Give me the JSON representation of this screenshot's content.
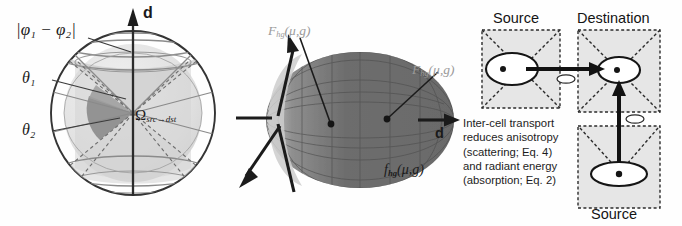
{
  "figure": {
    "background": "#fefefe",
    "panels": [
      "angular-domain-sphere",
      "henyey-greenstein-lobe",
      "inter-cell-transport"
    ]
  },
  "panel_left": {
    "name": "angular-domain-sphere",
    "axis_label": "d",
    "labels": {
      "phi_diff": "|φ₁ − φ₂|",
      "theta1": "θ₁",
      "theta2": "θ₂",
      "omega": "Ω",
      "omega_sub": "src→dst"
    },
    "colors": {
      "sphere_outline": "#3a3a3a",
      "sphere_fill": "#d9d9d9",
      "cone_fill": "#c2c2c2",
      "inner_fill": "#a8a8a8",
      "solid_angle_fill": "#9a9a9a",
      "grid": "#8d8d8d",
      "axis": "#2b2b2b",
      "leader": "#3a3a3a"
    }
  },
  "panel_mid": {
    "name": "henyey-greenstein-lobe",
    "axis_label": "d",
    "labels": {
      "F_upper": "F",
      "F_upper_sub": "hg",
      "F_upper_args": "(μ,g)",
      "F_right": "F",
      "F_right_sub": "hg",
      "F_right_args": "(μ,g)",
      "f_lower": "f",
      "f_lower_sub": "hg",
      "f_lower_args": "(μ,g)"
    },
    "colors": {
      "lobe_dark": "#6e6e6e",
      "lobe_light": "#cfcfcf",
      "lobe_mid": "#909090",
      "mesh": "#4f4f4f",
      "arrow": "#1e1e1e",
      "label_gray": "#9a9a9a",
      "label_black": "#141414"
    }
  },
  "panel_right": {
    "name": "inter-cell-transport",
    "headings": {
      "source_top": "Source",
      "destination": "Destination",
      "source_bottom": "Source"
    },
    "caption_lines": [
      "Inter-cell transport",
      "reduces anisotropy",
      "(scattering; Eq. 4)",
      "and radiant energy",
      "(absorption; Eq. 2)"
    ],
    "colors": {
      "cell_fill": "#e6e6e6",
      "cell_border": "#2b2b2b",
      "lobe_stroke": "#1a1a1a",
      "lobe_fill": "#ffffff",
      "arrow": "#121212",
      "text": "#1c1c1c"
    }
  }
}
